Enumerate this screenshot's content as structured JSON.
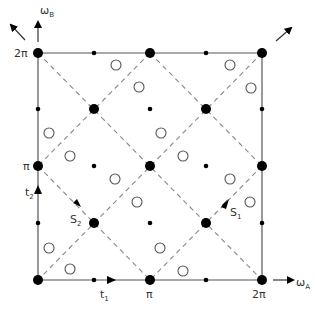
{
  "axes": {
    "x_label": "ω",
    "x_sub": "A",
    "y_label": "ω",
    "y_sub": "B",
    "x_ticks": [
      "π",
      "2π"
    ],
    "y_ticks": [
      "π",
      "2π"
    ]
  },
  "vectors": {
    "t1": {
      "label": "t",
      "sub": "1"
    },
    "t2": {
      "label": "t",
      "sub": "2"
    },
    "S1": {
      "label": "S",
      "sub": "1"
    },
    "S2": {
      "label": "S",
      "sub": "2"
    }
  },
  "grid": {
    "left": 38,
    "right": 262,
    "top": 53,
    "bottom": 280
  },
  "large_dots": [
    [
      38,
      53
    ],
    [
      150,
      53
    ],
    [
      262,
      53
    ],
    [
      94,
      109
    ],
    [
      206,
      109
    ],
    [
      38,
      166
    ],
    [
      150,
      166
    ],
    [
      262,
      166
    ],
    [
      94,
      223
    ],
    [
      206,
      223
    ],
    [
      38,
      280
    ],
    [
      150,
      280
    ],
    [
      262,
      280
    ]
  ],
  "small_dots": [
    [
      94,
      53
    ],
    [
      206,
      53
    ],
    [
      38,
      109
    ],
    [
      150,
      109
    ],
    [
      262,
      109
    ],
    [
      94,
      166
    ],
    [
      206,
      166
    ],
    [
      38,
      223
    ],
    [
      150,
      223
    ],
    [
      262,
      223
    ],
    [
      94,
      280
    ],
    [
      206,
      280
    ]
  ],
  "open_circles": [
    [
      116,
      65
    ],
    [
      139,
      87
    ],
    [
      49,
      133
    ],
    [
      70,
      156
    ],
    [
      230,
      65
    ],
    [
      251,
      88
    ],
    [
      161,
      133
    ],
    [
      183,
      156
    ],
    [
      115,
      179
    ],
    [
      137,
      202
    ],
    [
      49,
      248
    ],
    [
      70,
      269
    ],
    [
      230,
      179
    ],
    [
      250,
      202
    ],
    [
      160,
      248
    ],
    [
      183,
      271
    ]
  ],
  "colors": {
    "line": "#555555",
    "dash": "#888888",
    "dot": "#000000"
  }
}
